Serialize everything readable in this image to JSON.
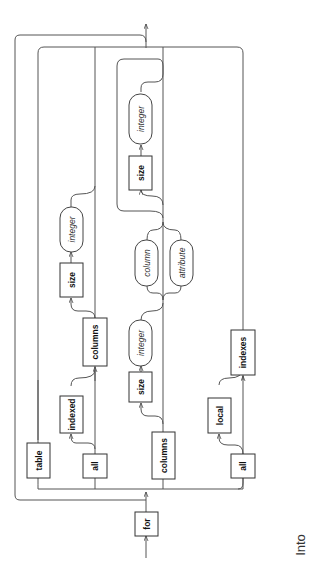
{
  "diagram": {
    "type": "railroad-syntax-diagram",
    "orientation": "rotated-90-ccw",
    "start_keyword": "for",
    "keywords": {
      "for": "for",
      "table": "table",
      "all_1": "all",
      "indexed": "indexed",
      "columns_1": "columns",
      "size_1": "size",
      "columns_2": "columns",
      "size_2": "size",
      "size_3": "size",
      "all_2": "all",
      "local": "local",
      "indexes": "indexes"
    },
    "nonterminals": {
      "integer_1": "integer",
      "integer_2": "integer",
      "column": "column",
      "attribute": "attribute",
      "integer_3": "integer"
    }
  },
  "caption": "Into"
}
